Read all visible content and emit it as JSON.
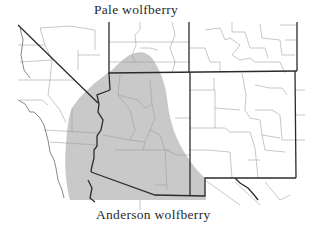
{
  "map": {
    "labels": {
      "top": "Pale wolfberry",
      "bottom": "Anderson wolfberry"
    },
    "region": "Southwestern United States (California, Nevada, Utah, Colorado, Arizona, New Mexico)",
    "colors": {
      "range_shading": "#c9c9c9",
      "state_boundary": "#2b2b2b",
      "county_boundary": "#9a9a9a",
      "background": "#ffffff",
      "text": "#2a2a2a"
    },
    "legend_items": [
      {
        "label": "Pale wolfberry",
        "position": "top"
      },
      {
        "label": "Anderson wolfberry",
        "position": "bottom"
      }
    ]
  }
}
